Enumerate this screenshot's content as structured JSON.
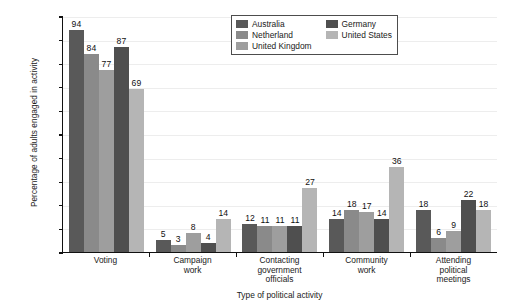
{
  "chart_data": {
    "type": "bar",
    "title": "",
    "xlabel": "Type of political activity",
    "ylabel": "Percentage of adults engaged in activity",
    "ylim": [
      0,
      100
    ],
    "ytick_labels": [
      "100%",
      "90%",
      "80%",
      "70%",
      "60%",
      "50%",
      "40%",
      "30%",
      "20%",
      "10%",
      "0%"
    ],
    "ytick_values": [
      100,
      90,
      80,
      70,
      60,
      50,
      40,
      30,
      20,
      10,
      0
    ],
    "grid": true,
    "legend_position": "top-right",
    "categories": [
      "Voting",
      "Campaign\nwork",
      "Contacting\ngovernment\nofficials",
      "Community\nwork",
      "Attending\npolitical\nmeetings"
    ],
    "series": [
      {
        "name": "Australia",
        "color": "#595959",
        "values": [
          94,
          5,
          12,
          14,
          18
        ]
      },
      {
        "name": "Netherland",
        "color": "#8a8a8a",
        "values": [
          84,
          3,
          11,
          18,
          6
        ]
      },
      {
        "name": "United Kingdom",
        "color": "#9e9e9e",
        "values": [
          77,
          8,
          11,
          17,
          9
        ]
      },
      {
        "name": "Germany",
        "color": "#4f4f4f",
        "values": [
          87,
          4,
          11,
          14,
          22
        ]
      },
      {
        "name": "United States",
        "color": "#b5b5b5",
        "values": [
          69,
          14,
          27,
          36,
          18
        ]
      }
    ],
    "legend": {
      "columns": [
        [
          "Australia",
          "Netherland",
          "United Kingdom"
        ],
        [
          "Germany",
          "United States"
        ]
      ]
    }
  }
}
